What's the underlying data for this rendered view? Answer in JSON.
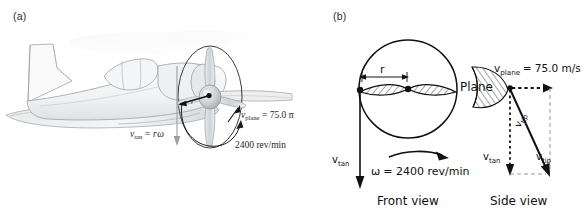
{
  "figure": {
    "background_color": "#ffffff",
    "ink_color": "#111111",
    "sketch_gray": "#b9bcc0"
  },
  "panel_a": {
    "label": "(a)",
    "caption_artwork": "airplane-side-view-line-drawing",
    "labels": {
      "v_tan": "v",
      "v_tan_sub": "tan",
      "v_tan_eq": "= r",
      "v_tan_omega": "ω",
      "v_plane": "v",
      "v_plane_sub": "plane",
      "v_plane_value": "= 75.0 m/s",
      "rpm": "2400 rev/min",
      "radius": "r"
    }
  },
  "panel_b": {
    "label": "(b)",
    "front_view": {
      "title": "Front view",
      "radius_label": "r",
      "omega_symbol": "ω",
      "omega_value": "= 2400 rev/min",
      "v_tan_label": "v",
      "v_tan_sub": "tan"
    },
    "side_view": {
      "title": "Side view",
      "plane_label": "Plane",
      "v_plane_label": "v",
      "v_plane_sub": "plane",
      "v_plane_value": "= 75.0 m/s",
      "v_tan_label": "v",
      "v_tan_sub": "tan",
      "v_tip_label": "v",
      "v_tip_sub": "tip",
      "v_tip_diag_label": "v",
      "v_tip_diag_sub": "tip"
    }
  }
}
